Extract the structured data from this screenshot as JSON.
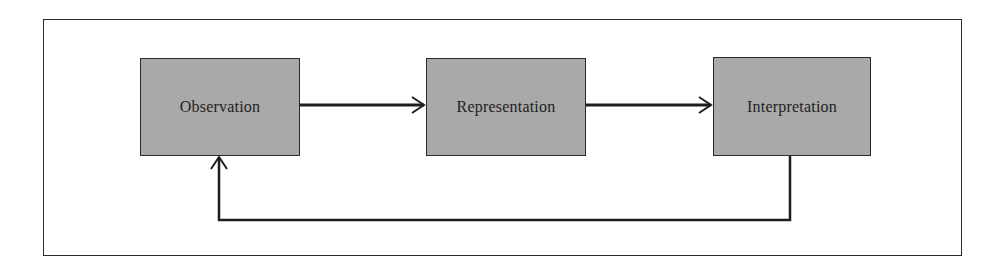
{
  "diagram": {
    "type": "flow-cycle",
    "nodes": [
      {
        "id": "observation",
        "label": "Observation"
      },
      {
        "id": "representation",
        "label": "Representation"
      },
      {
        "id": "interpretation",
        "label": "Interpretation"
      }
    ],
    "edges": [
      {
        "from": "observation",
        "to": "representation"
      },
      {
        "from": "representation",
        "to": "interpretation"
      },
      {
        "from": "interpretation",
        "to": "observation",
        "route": "feedback-below"
      }
    ],
    "colors": {
      "node_fill": "#a9a9a9",
      "stroke": "#1e1e1e",
      "background": "#ffffff"
    }
  }
}
